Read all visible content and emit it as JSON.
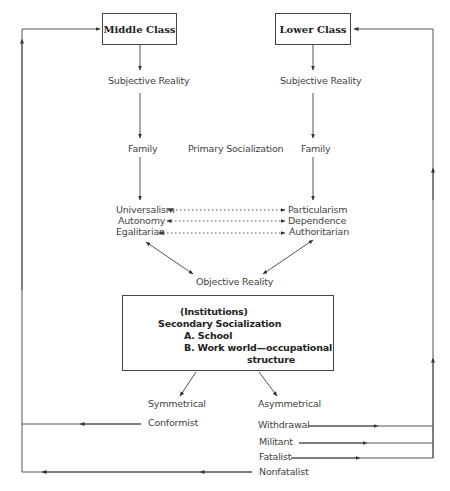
{
  "diagram": {
    "classes": {
      "middle": "Middle Class",
      "lower": "Lower Class"
    },
    "left_column": {
      "subjective": "Subjective Reality",
      "family": "Family",
      "traits": [
        "Universalism",
        "Autonomy",
        "Egalitarian"
      ]
    },
    "right_column": {
      "subjective": "Subjective Reality",
      "family": "Family",
      "traits": [
        "Particularism",
        "Dependence",
        "Authoritarian"
      ]
    },
    "primary_socialization": "Primary Socialization",
    "objective_reality": "Objective Reality",
    "institutions_box": {
      "line1": "(Institutions)",
      "line2": "Secondary Socialization",
      "line3": "A. School",
      "line4": "B. Work world—occupational",
      "line5": "structure"
    },
    "outcomes": {
      "symmetrical": "Symmetrical",
      "asymmetrical": "Asymmetrical",
      "conformist": "Conformist",
      "withdrawal": "Withdrawal",
      "militant": "Militant",
      "fatalist": "Fatalist",
      "nonfatalist": "Nonfatalist"
    },
    "colors": {
      "line": "#555555",
      "text": "#444444"
    }
  }
}
